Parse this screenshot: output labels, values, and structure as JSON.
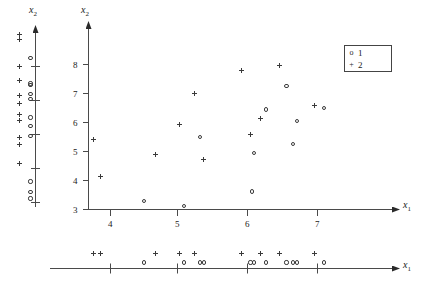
{
  "figure": {
    "kind": "scatterplot-with-marginal-rug-axes",
    "background": "#ffffff",
    "ink_color": "#2a2a2a"
  },
  "labels": {
    "y_axis_main": "x",
    "y_axis_main_sub": "2",
    "y_axis_marginal": "x",
    "y_axis_marginal_sub": "2",
    "x_axis_main": "x",
    "x_axis_main_sub": "1",
    "x_axis_marginal": "x",
    "x_axis_marginal_sub": "1"
  },
  "legend": {
    "position": "top-right",
    "entries": [
      {
        "symbol": "o",
        "label": "1"
      },
      {
        "symbol": "+",
        "label": "2"
      }
    ]
  },
  "chart_data": {
    "type": "scatter",
    "title": "",
    "xlabel": "x1",
    "ylabel": "x2",
    "xlim": [
      3.5,
      7.6
    ],
    "ylim": [
      2.8,
      8.6
    ],
    "xticks": [
      4,
      5,
      6,
      7
    ],
    "xtick_labels": [
      "4",
      "5",
      "6",
      "7"
    ],
    "yticks": [
      3,
      4,
      5,
      6,
      7,
      8
    ],
    "ytick_labels": [
      "3",
      "4",
      "5",
      "6",
      "7",
      "8"
    ],
    "grid": false,
    "legend_position": "top-right",
    "series": [
      {
        "name": "1",
        "marker": "o",
        "points": [
          {
            "x": 4.48,
            "y": 3.3
          },
          {
            "x": 5.06,
            "y": 3.12
          },
          {
            "x": 5.3,
            "y": 5.5
          },
          {
            "x": 6.05,
            "y": 3.62
          },
          {
            "x": 6.08,
            "y": 4.95
          },
          {
            "x": 6.25,
            "y": 6.45
          },
          {
            "x": 6.55,
            "y": 7.25
          },
          {
            "x": 6.65,
            "y": 5.25
          },
          {
            "x": 6.7,
            "y": 6.05
          },
          {
            "x": 7.1,
            "y": 6.5
          }
        ]
      },
      {
        "name": "2",
        "marker": "+",
        "points": [
          {
            "x": 3.75,
            "y": 5.42
          },
          {
            "x": 3.85,
            "y": 4.15
          },
          {
            "x": 4.65,
            "y": 4.9
          },
          {
            "x": 5.0,
            "y": 5.92
          },
          {
            "x": 5.22,
            "y": 7.0
          },
          {
            "x": 5.35,
            "y": 4.72
          },
          {
            "x": 5.9,
            "y": 7.78
          },
          {
            "x": 6.03,
            "y": 5.58
          },
          {
            "x": 6.18,
            "y": 6.15
          },
          {
            "x": 6.45,
            "y": 7.95
          },
          {
            "x": 6.95,
            "y": 6.6
          }
        ]
      }
    ]
  },
  "marginal_y": {
    "axis": "x2",
    "range": [
      2.8,
      8.6
    ],
    "ticks": [
      3,
      4,
      5,
      6,
      7,
      8
    ],
    "circles": [
      3.12,
      3.3,
      3.62,
      4.95,
      5.25,
      5.5,
      6.05,
      6.2,
      6.45,
      6.5,
      7.25
    ],
    "plusses": [
      4.15,
      4.72,
      4.9,
      5.42,
      5.58,
      5.92,
      6.15,
      6.6,
      7.0,
      7.78,
      7.95
    ]
  },
  "marginal_x": {
    "axis": "x1",
    "range": [
      3.5,
      7.6
    ],
    "ticks": [
      4,
      5,
      6,
      7
    ],
    "circles": [
      4.48,
      5.06,
      5.3,
      5.35,
      6.03,
      6.08,
      6.25,
      6.55,
      6.65,
      6.7,
      7.1
    ],
    "plusses": [
      3.75,
      3.85,
      4.65,
      5.0,
      5.22,
      5.9,
      6.18,
      6.45,
      6.95
    ]
  }
}
